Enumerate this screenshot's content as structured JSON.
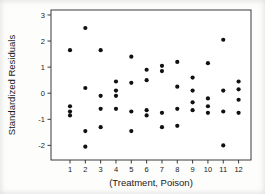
{
  "chart_data": {
    "type": "scatter",
    "title": "",
    "xlabel": "(Treatment, Poison)",
    "ylabel": "Standardized Residuals",
    "x_tick_labels": [
      "1",
      "2",
      "3",
      "4",
      "5",
      "6",
      "7",
      "8",
      "9",
      "10",
      "11",
      "12"
    ],
    "x_tick_values": [
      1,
      2,
      3,
      4,
      5,
      6,
      7,
      8,
      9,
      10,
      11,
      12
    ],
    "y_tick_labels": [
      "3",
      "2",
      "1",
      "0",
      "-1",
      "-2"
    ],
    "y_tick_values": [
      3,
      2,
      1,
      0,
      -1,
      -2
    ],
    "xlim": [
      -0.24,
      12.81
    ],
    "ylim": [
      -2.56,
      3.19
    ],
    "grid": false,
    "legend": null,
    "marker": {
      "shape": "circle",
      "color": "#111111",
      "radius": 2.1
    },
    "frame_color": "#3a3a3a",
    "points": [
      {
        "x": 1,
        "y": 1.65
      },
      {
        "x": 1,
        "y": -0.5
      },
      {
        "x": 1,
        "y": -0.7
      },
      {
        "x": 1,
        "y": -0.85
      },
      {
        "x": 2,
        "y": 2.5
      },
      {
        "x": 2,
        "y": 0.2
      },
      {
        "x": 2,
        "y": -1.45
      },
      {
        "x": 2,
        "y": -2.05
      },
      {
        "x": 3,
        "y": 1.65
      },
      {
        "x": 3,
        "y": -0.1
      },
      {
        "x": 3,
        "y": -0.6
      },
      {
        "x": 3,
        "y": -1.3
      },
      {
        "x": 4,
        "y": 0.45
      },
      {
        "x": 4,
        "y": 0.1
      },
      {
        "x": 4,
        "y": -0.1
      },
      {
        "x": 4,
        "y": -0.6
      },
      {
        "x": 5,
        "y": 1.4
      },
      {
        "x": 5,
        "y": 0.4
      },
      {
        "x": 5,
        "y": -0.7
      },
      {
        "x": 5,
        "y": -1.45
      },
      {
        "x": 6,
        "y": 0.9
      },
      {
        "x": 6,
        "y": 0.5
      },
      {
        "x": 6,
        "y": -0.65
      },
      {
        "x": 6,
        "y": -0.85
      },
      {
        "x": 7,
        "y": 1.05
      },
      {
        "x": 7,
        "y": 0.85
      },
      {
        "x": 7,
        "y": -0.75
      },
      {
        "x": 7,
        "y": -1.3
      },
      {
        "x": 8,
        "y": 1.2
      },
      {
        "x": 8,
        "y": 0.25
      },
      {
        "x": 8,
        "y": -0.6
      },
      {
        "x": 8,
        "y": -1.25
      },
      {
        "x": 9,
        "y": 0.6
      },
      {
        "x": 9,
        "y": 0.1
      },
      {
        "x": 9,
        "y": -0.35
      },
      {
        "x": 9,
        "y": -0.65
      },
      {
        "x": 10,
        "y": 1.15
      },
      {
        "x": 10,
        "y": -0.2
      },
      {
        "x": 10,
        "y": -0.5
      },
      {
        "x": 10,
        "y": -0.75
      },
      {
        "x": 11,
        "y": 2.05
      },
      {
        "x": 11,
        "y": 0.1
      },
      {
        "x": 11,
        "y": -0.7
      },
      {
        "x": 11,
        "y": -2.0
      },
      {
        "x": 12,
        "y": 0.45
      },
      {
        "x": 12,
        "y": 0.15
      },
      {
        "x": 12,
        "y": -0.25
      },
      {
        "x": 12,
        "y": -0.75
      }
    ]
  }
}
